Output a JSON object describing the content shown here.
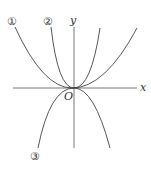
{
  "diagram": {
    "axes": {
      "x_label": "x",
      "y_label": "y",
      "origin_label": "O"
    },
    "curves": [
      {
        "id": "1",
        "label": "①",
        "shape": "upward parabola (wide)"
      },
      {
        "id": "2",
        "label": "②",
        "shape": "upward parabola (narrow)"
      },
      {
        "id": "3",
        "label": "③",
        "shape": "downward parabola"
      }
    ],
    "stroke_color": "#444444"
  }
}
